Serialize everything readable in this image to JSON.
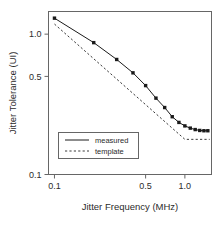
{
  "chart_data": {
    "type": "line",
    "title": "",
    "xlabel": "Jitter Frequency (MHz)",
    "ylabel": "Jitter Tolerance (UI)",
    "xscale": "log",
    "yscale": "log",
    "xlim": [
      0.09,
      1.6
    ],
    "ylim": [
      0.1,
      1.45
    ],
    "xticks": [
      0.1,
      0.5,
      1.0
    ],
    "xtick_labels": [
      "0.1",
      "0.5",
      "1.0"
    ],
    "yticks": [
      0.1,
      0.5,
      1.0
    ],
    "ytick_labels": [
      "0.1",
      "0.5",
      "1.0"
    ],
    "grid": false,
    "legend_position": "lower-left",
    "series": [
      {
        "name": "measured",
        "style": "solid",
        "marker": "filled-square",
        "color": "#1a1a1a",
        "points": [
          {
            "x": 0.1,
            "y": 1.3
          },
          {
            "x": 0.2,
            "y": 0.87
          },
          {
            "x": 0.3,
            "y": 0.66
          },
          {
            "x": 0.4,
            "y": 0.53
          },
          {
            "x": 0.5,
            "y": 0.43
          },
          {
            "x": 0.6,
            "y": 0.35
          },
          {
            "x": 0.7,
            "y": 0.3
          },
          {
            "x": 0.8,
            "y": 0.258
          },
          {
            "x": 0.9,
            "y": 0.235
          },
          {
            "x": 1.0,
            "y": 0.222
          },
          {
            "x": 1.1,
            "y": 0.214
          },
          {
            "x": 1.2,
            "y": 0.209
          },
          {
            "x": 1.3,
            "y": 0.206
          },
          {
            "x": 1.4,
            "y": 0.205
          },
          {
            "x": 1.5,
            "y": 0.205
          }
        ]
      },
      {
        "name": "template",
        "style": "dashed",
        "marker": "none",
        "color": "#3a3a3a",
        "points": [
          {
            "x": 0.1,
            "y": 1.18
          },
          {
            "x": 1.0,
            "y": 0.178
          },
          {
            "x": 1.55,
            "y": 0.178
          }
        ]
      }
    ]
  },
  "legend": {
    "entries": [
      {
        "label": "measured",
        "style": "solid"
      },
      {
        "label": "template",
        "style": "dashed"
      }
    ]
  },
  "colors": {
    "axis": "#555555",
    "line": "#1a1a1a",
    "text": "#2b2b2b",
    "background": "#ffffff"
  }
}
